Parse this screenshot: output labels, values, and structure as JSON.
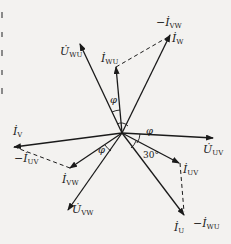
{
  "diagram": {
    "type": "phasor-diagram",
    "origin": [
      122,
      133
    ],
    "phasors": [
      {
        "id": "U_WU",
        "label_main": "U̇",
        "label_sub": "WU",
        "kind": "voltage",
        "tip": [
          80,
          44
        ]
      },
      {
        "id": "I_WU",
        "label_main": "İ",
        "label_sub": "WU",
        "kind": "current",
        "tip": [
          116,
          67
        ]
      },
      {
        "id": "I_W",
        "label_main": "İ",
        "label_sub": "W",
        "kind": "current",
        "tip": [
          170,
          35
        ]
      },
      {
        "id": "I_V",
        "label_main": "İ",
        "label_sub": "V",
        "kind": "current",
        "tip": [
          14,
          147
        ]
      },
      {
        "id": "U_UV",
        "label_main": "U̇",
        "label_sub": "UV",
        "kind": "voltage",
        "tip": [
          213,
          138
        ]
      },
      {
        "id": "I_VW",
        "label_main": "İ",
        "label_sub": "VW",
        "kind": "current",
        "tip": [
          70,
          168
        ]
      },
      {
        "id": "U_VW",
        "label_main": "U̇",
        "label_sub": "VW",
        "kind": "voltage",
        "tip": [
          68,
          210
        ]
      },
      {
        "id": "I_UV",
        "label_main": "İ",
        "label_sub": "UV",
        "kind": "current",
        "tip": [
          179,
          163
        ]
      },
      {
        "id": "I_U",
        "label_main": "İ",
        "label_sub": "U",
        "kind": "current",
        "tip": [
          184,
          215
        ]
      }
    ],
    "dashed_vectors": [
      {
        "id": "neg_I_VW",
        "label_main": "−İ",
        "label_sub": "VW",
        "from": [
          116,
          67
        ],
        "to": [
          170,
          35
        ]
      },
      {
        "id": "neg_I_UV",
        "label_main": "−İ",
        "label_sub": "UV",
        "from": [
          70,
          168
        ],
        "to": [
          14,
          147
        ]
      },
      {
        "id": "neg_I_WU",
        "label_main": "−İ",
        "label_sub": "WU",
        "from": [
          179,
          163
        ],
        "to": [
          184,
          215
        ]
      }
    ],
    "angles": [
      {
        "id": "phi_top",
        "text": "φ"
      },
      {
        "id": "phi_right",
        "text": "φ"
      },
      {
        "id": "phi_lower_left",
        "text": "φ"
      },
      {
        "id": "angle_30",
        "text": "30°"
      }
    ],
    "colors": {
      "line": "#1a1a1a",
      "background": "#f3f2f0"
    }
  },
  "labels": {
    "U_WU": {
      "main": "U̇",
      "sub": "WU"
    },
    "I_WU": {
      "main": "İ",
      "sub": "WU"
    },
    "neg_I_VW": {
      "main": "−İ",
      "sub": "VW"
    },
    "I_W": {
      "main": "İ",
      "sub": "W"
    },
    "I_V": {
      "main": "İ",
      "sub": "V"
    },
    "neg_I_UV": {
      "main": "−İ",
      "sub": "UV"
    },
    "U_UV": {
      "main": "U̇",
      "sub": "UV"
    },
    "I_VW": {
      "main": "İ",
      "sub": "VW"
    },
    "U_VW": {
      "main": "U̇",
      "sub": "VW"
    },
    "I_UV": {
      "main": "İ",
      "sub": "UV"
    },
    "I_U": {
      "main": "İ",
      "sub": "U"
    },
    "neg_I_WU": {
      "main": "−İ",
      "sub": "WU"
    },
    "phi_top": "φ",
    "phi_right": "φ",
    "phi_lower_left": "φ",
    "angle_30": "30°"
  }
}
